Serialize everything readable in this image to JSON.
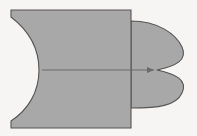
{
  "figure": {
    "canvas": {
      "width": 197,
      "height": 136
    },
    "background_color": "#f6f5f3",
    "fill_color": "#a8a8a8",
    "stroke_color": "#555555",
    "arrow_color": "#6b6b6b",
    "stroke_width": 1.1,
    "shapes": [
      {
        "name": "left-cusped-block",
        "kind": "rectangle-with-cusped-left-edge",
        "rect": {
          "x": 11,
          "y": 10,
          "width": 120,
          "height": 118
        },
        "cusp_point": {
          "x": 39,
          "y": 70
        },
        "notch_depth": 28,
        "path": "M 131 10 L 11 10 L 11 17 C 28 30 39 48 39 70 C 39 92 28 110 11 121 L 11 128 L 131 128 Z"
      },
      {
        "name": "right-lobed-shape",
        "kind": "mirrored-lobe-pair",
        "anchor_x": 131,
        "cusp_point": {
          "x": 157,
          "y": 70
        },
        "extent_right": 184,
        "extent_top": 21,
        "extent_bottom": 108,
        "path": "M 131 21 C 158 21 176 34 182 47 C 188 60 176 66 157 70 C 176 74 188 80 182 93 C 176 106 158 108 131 108 Z"
      }
    ],
    "arrow": {
      "name": "translation-arrow",
      "from": {
        "x": 42,
        "y": 70
      },
      "to": {
        "x": 154,
        "y": 70
      },
      "head_length": 7,
      "head_half_width": 3
    },
    "labels": []
  }
}
